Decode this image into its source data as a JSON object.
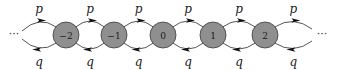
{
  "diagram": {
    "type": "birth-death-chain",
    "nodes": [
      {
        "label": "−2",
        "x": 66
      },
      {
        "label": "−1",
        "x": 114
      },
      {
        "label": "0",
        "x": 163
      },
      {
        "label": "1",
        "x": 213
      },
      {
        "label": "2",
        "x": 265
      }
    ],
    "forward_label": "p",
    "backward_label": "q",
    "left_ellipsis": "···",
    "right_ellipsis": "···",
    "colors": {
      "node_fill": "#8f8f8f",
      "node_stroke": "#3a3a3a",
      "edge": "#2a2a2a"
    }
  }
}
